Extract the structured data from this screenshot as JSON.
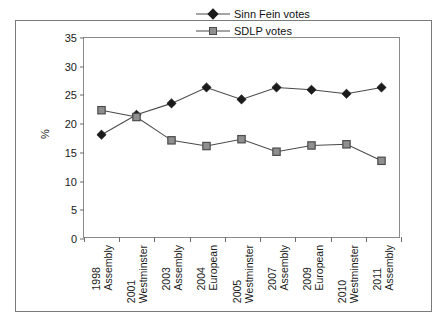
{
  "chart_data": {
    "type": "line",
    "title": "",
    "xlabel": "",
    "ylabel": "%",
    "ylim": [
      0,
      35
    ],
    "yticks": [
      0,
      5,
      10,
      15,
      20,
      25,
      30,
      35
    ],
    "grid": false,
    "legend_position": "top-right",
    "categories": [
      "1998 Assembly",
      "2001 Westminster",
      "2003 Assembly",
      "2004 European",
      "2005 Westminster",
      "2007 Assembly",
      "2009 European",
      "2010 Westminster",
      "2011 Assembly"
    ],
    "category_lines": [
      [
        "1998",
        "Assembly"
      ],
      [
        "2001",
        "Westminster"
      ],
      [
        "2003",
        "Assembly"
      ],
      [
        "2004",
        "European"
      ],
      [
        "2005",
        "Westminster"
      ],
      [
        "2007",
        "Assembly"
      ],
      [
        "2009",
        "European"
      ],
      [
        "2010",
        "Westminster"
      ],
      [
        "2011",
        "Assembly"
      ]
    ],
    "series": [
      {
        "name": "Sinn Fein votes",
        "marker": "diamond",
        "color": "#1b1b1b",
        "values": [
          18.0,
          21.5,
          23.5,
          26.3,
          24.2,
          26.3,
          25.9,
          25.2,
          26.3
        ]
      },
      {
        "name": "SDLP votes",
        "marker": "square",
        "color": "#8f8f8f",
        "values": [
          22.3,
          21.1,
          17.0,
          16.0,
          17.2,
          15.0,
          16.1,
          16.3,
          13.4
        ]
      }
    ]
  },
  "legend": {
    "items": [
      {
        "label": "Sinn Fein votes",
        "marker": "diamond"
      },
      {
        "label": "SDLP votes",
        "marker": "square"
      }
    ]
  },
  "axes": {
    "y_title": "%"
  },
  "colors": {
    "sinn_fein": "#1b1b1b",
    "sdlp": "#8f8f8f",
    "line": "#4a4a4a",
    "frame": "#7a7a7a",
    "text": "#1a1a1a"
  }
}
